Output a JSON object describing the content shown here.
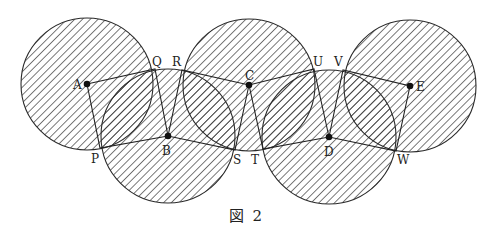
{
  "top_fragment": "",
  "caption": "図 2",
  "colors": {
    "line": "#222222",
    "hatch": "#333333",
    "background": "#ffffff"
  },
  "diagram": {
    "circles": [
      {
        "name": "A",
        "cx": 87,
        "cy": 84,
        "r": 66
      },
      {
        "name": "B",
        "cx": 168,
        "cy": 136,
        "r": 67
      },
      {
        "name": "C",
        "cx": 249,
        "cy": 85,
        "r": 66
      },
      {
        "name": "D",
        "cx": 329,
        "cy": 137,
        "r": 67
      },
      {
        "name": "E",
        "cx": 410,
        "cy": 86,
        "r": 66
      }
    ],
    "centers": {
      "A": {
        "label": "A",
        "x": 87,
        "y": 84
      },
      "B": {
        "label": "B",
        "x": 168,
        "y": 136
      },
      "C": {
        "label": "C",
        "x": 249,
        "y": 85
      },
      "D": {
        "label": "D",
        "x": 329,
        "y": 137
      },
      "E": {
        "label": "E",
        "x": 410,
        "y": 86
      }
    },
    "intersection_points": {
      "P": {
        "label": "P",
        "x": 100,
        "y": 148
      },
      "Q": {
        "label": "Q",
        "x": 155,
        "y": 69
      },
      "R": {
        "label": "R",
        "x": 182,
        "y": 70
      },
      "S": {
        "label": "S",
        "x": 235,
        "y": 150
      },
      "T": {
        "label": "T",
        "x": 263,
        "y": 149
      },
      "U": {
        "label": "U",
        "x": 314,
        "y": 69
      },
      "V": {
        "label": "V",
        "x": 343,
        "y": 70
      },
      "W": {
        "label": "W",
        "x": 396,
        "y": 151
      }
    },
    "polygon": [
      "A",
      "Q",
      "B",
      "R",
      "C",
      "U",
      "D",
      "V",
      "E",
      "W",
      "D",
      "T",
      "C",
      "S",
      "B",
      "P",
      "A"
    ],
    "labels": {
      "A": "A",
      "B": "B",
      "C": "C",
      "D": "D",
      "E": "E",
      "P": "P",
      "Q": "Q",
      "R": "R",
      "S": "S",
      "T": "T",
      "U": "U",
      "V": "V",
      "W": "W"
    }
  }
}
